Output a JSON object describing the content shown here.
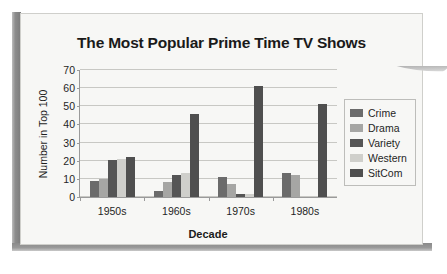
{
  "chart_data": {
    "type": "bar",
    "title": "The Most Popular Prime Time TV Shows",
    "xlabel": "Decade",
    "ylabel": "Number in Top 100",
    "categories": [
      "1950s",
      "1960s",
      "1970s",
      "1980s"
    ],
    "yticks": [
      0,
      10,
      20,
      30,
      40,
      50,
      60,
      70
    ],
    "ylim": [
      0,
      70
    ],
    "grid": "horizontal",
    "legend_position": "right",
    "series": [
      {
        "name": "Crime",
        "color": "#6b6b6b",
        "values": [
          9,
          3.5,
          11,
          13.5
        ]
      },
      {
        "name": "Drama",
        "color": "#a6a6a4",
        "values": [
          10,
          8.5,
          7,
          12
        ]
      },
      {
        "name": "Variety",
        "color": "#555555",
        "values": [
          20.5,
          12,
          1.5,
          0
        ]
      },
      {
        "name": "Western",
        "color": "#cfcfcb",
        "values": [
          21,
          13.5,
          1.5,
          0
        ]
      },
      {
        "name": "SitCom",
        "color": "#4f4f4f",
        "values": [
          22,
          46,
          61,
          51.5
        ]
      }
    ]
  }
}
